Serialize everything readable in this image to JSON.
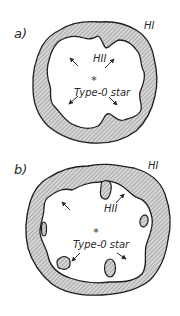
{
  "figure": {
    "colors": {
      "background": "#ffffff",
      "outline": "#1e1e1e",
      "hatch_fill": "#b8b8b8",
      "text": "#2a2a2a"
    },
    "panels": [
      {
        "id": "a",
        "label": "a)",
        "outer_region_label": "HI",
        "inner_region_label": "HII",
        "star_label": "Type-0 star",
        "star_symbol": "*",
        "arrow_count": 4,
        "globules": 0
      },
      {
        "id": "b",
        "label": "b)",
        "outer_region_label": "HI",
        "inner_region_label": "HII",
        "star_label": "Type-0 star",
        "star_symbol": "*",
        "arrow_count": 4,
        "globules": 5
      }
    ]
  }
}
